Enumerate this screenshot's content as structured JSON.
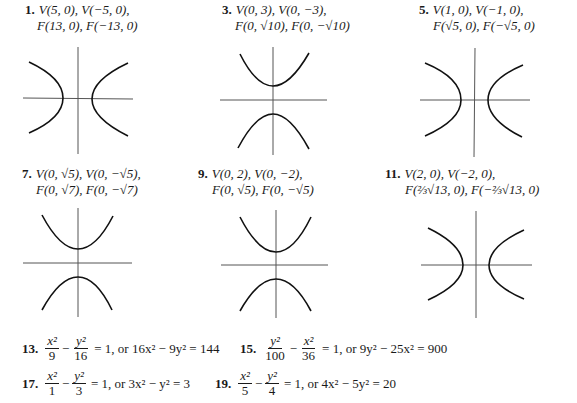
{
  "problems": [
    {
      "number": "1.",
      "line1": "V(5, 0), V(−5, 0),",
      "line2": "F(13, 0), F(−13, 0)",
      "orientation": "horizontal"
    },
    {
      "number": "3.",
      "line1": "V(0, 3), V(0, −3),",
      "line2": "F(0, √10), F(0, −√10)",
      "orientation": "vertical"
    },
    {
      "number": "5.",
      "line1": "V(1, 0), V(−1, 0),",
      "line2": "F(√5, 0), F(−√5, 0)",
      "orientation": "horizontal"
    },
    {
      "number": "7.",
      "line1": "V(0, √5), V(0, −√5),",
      "line2": "F(0, √7), F(0, −√7)",
      "orientation": "vertical"
    },
    {
      "number": "9.",
      "line1": "V(0, 2), V(0, −2),",
      "line2": "F(0, √5), F(0, −√5)",
      "orientation": "vertical"
    },
    {
      "number": "11.",
      "line1": "V(2, 0), V(−2, 0),",
      "line2": "F(⅔√13, 0), F(−⅔√13, 0)",
      "orientation": "horizontal"
    }
  ],
  "equations": [
    {
      "number": "13.",
      "t1_num": "x²",
      "t1_den": "9",
      "t2_num": "y²",
      "t2_den": "16",
      "rest": "= 1, or 16x² − 9y² = 144"
    },
    {
      "number": "15.",
      "t1_num": "y²",
      "t1_den": "100",
      "t2_num": "x²",
      "t2_den": "36",
      "rest": "= 1, or 9y² − 25x² = 900"
    },
    {
      "number": "17.",
      "t1_num": "x²",
      "t1_den": "1",
      "t2_num": "y²",
      "t2_den": "3",
      "rest": "= 1, or 3x² − y² = 3"
    },
    {
      "number": "19.",
      "t1_num": "x²",
      "t1_den": "5",
      "t2_num": "y²",
      "t2_den": "4",
      "rest": "= 1, or 4x² − 5y² = 20"
    }
  ],
  "minus_sign": "−"
}
